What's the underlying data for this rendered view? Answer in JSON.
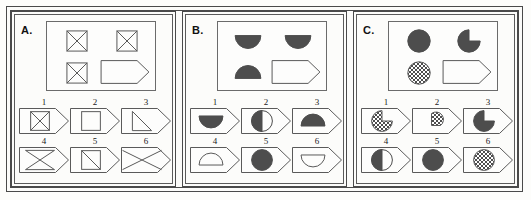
{
  "figure": {
    "colors": {
      "ink": "#4a4a4a",
      "fill_dark": "#4d4d4d",
      "outline": "#5a5a5a",
      "paper": "#fcfcfa"
    }
  },
  "panels": [
    {
      "letter": "A.",
      "matrix": {
        "cells": [
          {
            "position": "top-left",
            "shape": "square-with-x",
            "fill": "outline"
          },
          {
            "position": "top-right",
            "shape": "square-with-x",
            "fill": "outline"
          },
          {
            "position": "bottom-left",
            "shape": "square-with-x",
            "fill": "outline"
          },
          {
            "position": "bottom-right",
            "shape": "tag-pentagon-blank",
            "fill": "outline"
          }
        ]
      },
      "options": [
        {
          "number": "1",
          "shape": "square-with-x",
          "fill": "outline"
        },
        {
          "number": "2",
          "shape": "square-plain",
          "fill": "outline"
        },
        {
          "number": "3",
          "shape": "triangle-right-lower",
          "fill": "outline"
        },
        {
          "number": "4",
          "shape": "bowtie-hourglass",
          "fill": "outline"
        },
        {
          "number": "5",
          "shape": "square-with-diagonal",
          "fill": "outline"
        },
        {
          "number": "6",
          "shape": "large-x",
          "fill": "outline"
        }
      ]
    },
    {
      "letter": "B.",
      "matrix": {
        "cells": [
          {
            "position": "top-left",
            "shape": "semicircle-down",
            "fill": "solid"
          },
          {
            "position": "top-right",
            "shape": "semicircle-down",
            "fill": "solid"
          },
          {
            "position": "bottom-left",
            "shape": "semicircle-up",
            "fill": "solid"
          },
          {
            "position": "bottom-right",
            "shape": "tag-pentagon-blank",
            "fill": "outline"
          }
        ]
      },
      "options": [
        {
          "number": "1",
          "shape": "semicircle-down",
          "fill": "solid"
        },
        {
          "number": "2",
          "shape": "half-circle-left",
          "fill": "solid"
        },
        {
          "number": "3",
          "shape": "semicircle-up",
          "fill": "solid"
        },
        {
          "number": "4",
          "shape": "semicircle-up",
          "fill": "outline"
        },
        {
          "number": "5",
          "shape": "circle-full",
          "fill": "solid"
        },
        {
          "number": "6",
          "shape": "semicircle-down",
          "fill": "outline"
        }
      ]
    },
    {
      "letter": "C.",
      "matrix": {
        "cells": [
          {
            "position": "top-left",
            "shape": "circle-full",
            "fill": "solid"
          },
          {
            "position": "top-right",
            "shape": "pacman-circle",
            "fill": "solid"
          },
          {
            "position": "bottom-left",
            "shape": "circle-full",
            "fill": "checkered"
          },
          {
            "position": "bottom-right",
            "shape": "tag-pentagon-blank",
            "fill": "outline"
          }
        ]
      },
      "options": [
        {
          "number": "1",
          "shape": "pacman-circle",
          "fill": "checkered"
        },
        {
          "number": "2",
          "shape": "pie-wedge-small",
          "fill": "checkered"
        },
        {
          "number": "3",
          "shape": "pacman-circle",
          "fill": "solid"
        },
        {
          "number": "4",
          "shape": "half-circle-left",
          "fill": "solid"
        },
        {
          "number": "5",
          "shape": "circle-full",
          "fill": "solid"
        },
        {
          "number": "6",
          "shape": "circle-full",
          "fill": "checkered"
        }
      ]
    }
  ]
}
